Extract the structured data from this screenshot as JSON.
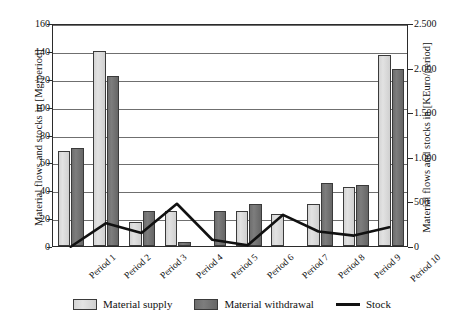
{
  "chart_data": {
    "type": "bar",
    "title": "",
    "subtitle": "",
    "categories": [
      "Period 1",
      "Period 2",
      "Period 3",
      "Period 4",
      "Period 5",
      "Period 6",
      "Period 7",
      "Period 8",
      "Period 9",
      "Period 10"
    ],
    "series": [
      {
        "name": "Material supply",
        "type": "bar",
        "axis": "left",
        "color": "#dcdcdc",
        "values": [
          68,
          140,
          17,
          25,
          0,
          25,
          23,
          30,
          42,
          137
        ]
      },
      {
        "name": "Material withdrawal",
        "type": "bar",
        "axis": "left",
        "color": "#727272",
        "values": [
          70,
          122,
          25,
          3,
          25,
          30,
          0,
          45,
          44,
          127
        ]
      },
      {
        "name": "Stock",
        "type": "line",
        "axis": "left",
        "color": "#111111",
        "values": [
          0,
          17,
          10,
          31,
          5,
          1,
          23,
          11,
          8,
          14
        ]
      }
    ],
    "xlabel": "",
    "ylabel": "Material flows and stocks in [Mg/period]",
    "ylabel_right": "Material flows and stocks in [KEuro/period]",
    "ylim": [
      0,
      160
    ],
    "yticks": [
      0,
      20,
      40,
      60,
      80,
      100,
      120,
      140,
      160
    ],
    "ytick_labels": [
      "0",
      "20",
      "40",
      "60",
      "80",
      "100",
      "120",
      "140",
      "160"
    ],
    "ylim_right": [
      0,
      2500
    ],
    "yticks_right": [
      0,
      500,
      1000,
      1500,
      2000,
      2500
    ],
    "ytick_labels_right": [
      "0",
      "500",
      "1.000",
      "1.500",
      "2.000",
      "2.500"
    ],
    "grid": true,
    "grid_axis": "y",
    "legend_position": "bottom",
    "legend": [
      "Material supply",
      "Material withdrawal",
      "Stock"
    ]
  },
  "axes": {
    "left_title": "Material flows and stocks in [Mg/period]",
    "right_title": "Material flows and stocks in [KEuro/period]"
  },
  "legend": {
    "items": [
      {
        "label": "Material supply",
        "icon": "swatch-light"
      },
      {
        "label": "Material withdrawal",
        "icon": "swatch-dark"
      },
      {
        "label": "Stock",
        "icon": "line-black"
      }
    ]
  }
}
